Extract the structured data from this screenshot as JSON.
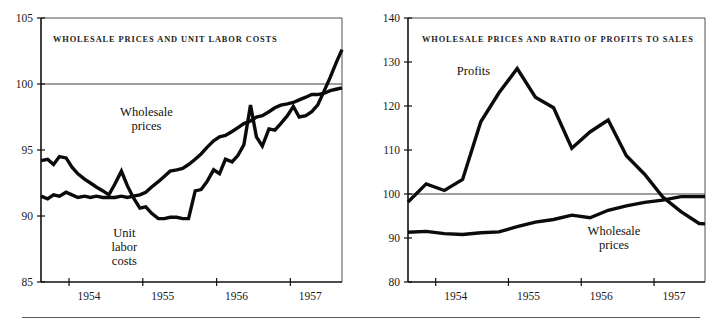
{
  "figure": {
    "background": "#ffffff",
    "line_color": "#0b0b0b",
    "axis_color": "#111111",
    "bottom_rule": true
  },
  "chart_data": [
    {
      "id": "left",
      "type": "line",
      "title": "WHOLESALE PRICES AND UNIT LABOR COSTS",
      "xlabel": "",
      "ylabel": "",
      "xlim": [
        1953.62,
        1957.7
      ],
      "ylim": [
        85,
        105
      ],
      "yticks": [
        85,
        90,
        95,
        100,
        105
      ],
      "ytick_labels": [
        "85",
        "90",
        "95",
        "100",
        "105"
      ],
      "xticks": [
        1954,
        1955,
        1956,
        1957
      ],
      "xtick_labels": [
        "1954",
        "1955",
        "1956",
        "1957"
      ],
      "grid": false,
      "reference_lines": [
        100
      ],
      "legend_position": "inline-annotations",
      "series": [
        {
          "name": "Wholesale prices",
          "label_x": 1955.05,
          "label_y": 97.6,
          "x": [
            1953.62,
            1953.71,
            1953.79,
            1953.87,
            1953.96,
            1954.04,
            1954.12,
            1954.21,
            1954.29,
            1954.37,
            1954.46,
            1954.54,
            1954.62,
            1954.71,
            1954.79,
            1954.87,
            1954.96,
            1955.04,
            1955.12,
            1955.21,
            1955.29,
            1955.37,
            1955.46,
            1955.54,
            1955.62,
            1955.71,
            1955.79,
            1955.87,
            1955.96,
            1956.04,
            1956.12,
            1956.21,
            1956.29,
            1956.37,
            1956.46,
            1956.54,
            1956.62,
            1956.71,
            1956.79,
            1956.87,
            1956.96,
            1957.04,
            1957.12,
            1957.21,
            1957.29,
            1957.37,
            1957.46,
            1957.54,
            1957.62,
            1957.7
          ],
          "y": [
            91.5,
            91.3,
            91.6,
            91.5,
            91.8,
            91.6,
            91.4,
            91.5,
            91.4,
            91.5,
            91.4,
            91.4,
            91.4,
            91.5,
            91.4,
            91.5,
            91.6,
            91.8,
            92.2,
            92.6,
            93.0,
            93.4,
            93.5,
            93.6,
            93.9,
            94.3,
            94.7,
            95.2,
            95.7,
            96.0,
            96.1,
            96.4,
            96.7,
            97.0,
            97.2,
            97.5,
            97.6,
            97.9,
            98.2,
            98.4,
            98.5,
            98.6,
            98.8,
            99.0,
            99.2,
            99.2,
            99.3,
            99.5,
            99.6,
            99.7
          ]
        },
        {
          "name": "Unit labor costs",
          "label_x": 1954.75,
          "label_y": 88.4,
          "x": [
            1953.62,
            1953.71,
            1953.79,
            1953.87,
            1953.96,
            1954.04,
            1954.12,
            1954.21,
            1954.29,
            1954.37,
            1954.46,
            1954.54,
            1954.62,
            1954.71,
            1954.79,
            1954.87,
            1954.96,
            1955.04,
            1955.12,
            1955.21,
            1955.29,
            1955.37,
            1955.46,
            1955.54,
            1955.62,
            1955.71,
            1955.79,
            1955.87,
            1955.96,
            1956.04,
            1956.12,
            1956.21,
            1956.29,
            1956.37,
            1956.46,
            1956.54,
            1956.62,
            1956.71,
            1956.79,
            1956.87,
            1956.96,
            1957.04,
            1957.12,
            1957.21,
            1957.29,
            1957.37,
            1957.46,
            1957.54,
            1957.62,
            1957.7
          ],
          "y": [
            94.2,
            94.3,
            93.9,
            94.5,
            94.4,
            93.7,
            93.2,
            92.8,
            92.5,
            92.2,
            91.9,
            91.6,
            92.4,
            93.4,
            92.3,
            91.4,
            90.6,
            90.7,
            90.2,
            89.8,
            89.8,
            89.9,
            89.9,
            89.8,
            89.8,
            91.9,
            92.0,
            92.6,
            93.5,
            93.2,
            94.3,
            94.1,
            94.6,
            95.4,
            98.4,
            96.0,
            95.3,
            96.6,
            96.5,
            97.0,
            97.6,
            98.3,
            97.5,
            97.6,
            97.9,
            98.4,
            99.5,
            100.5,
            101.6,
            102.6
          ]
        }
      ]
    },
    {
      "id": "right",
      "type": "line",
      "title": "WHOLESALE PRICES AND RATIO OF PROFITS TO SALES",
      "xlabel": "",
      "ylabel": "",
      "xlim": [
        1953.62,
        1957.7
      ],
      "ylim": [
        80,
        140
      ],
      "yticks": [
        80,
        90,
        100,
        110,
        120,
        130,
        140
      ],
      "ytick_labels": [
        "80",
        "90",
        "100",
        "110",
        "120",
        "130",
        "140"
      ],
      "xticks": [
        1954,
        1955,
        1956,
        1957
      ],
      "xtick_labels": [
        "1954",
        "1955",
        "1956",
        "1957"
      ],
      "grid": false,
      "reference_lines": [
        100
      ],
      "legend_position": "inline-annotations",
      "series": [
        {
          "name": "Profits",
          "label_x": 1954.52,
          "label_y": 127.0,
          "x": [
            1953.62,
            1953.87,
            1954.12,
            1954.37,
            1954.62,
            1954.87,
            1955.12,
            1955.37,
            1955.62,
            1955.87,
            1956.12,
            1956.37,
            1956.62,
            1956.87,
            1957.12,
            1957.37,
            1957.62,
            1957.7
          ],
          "y": [
            98.2,
            102.3,
            100.8,
            103.3,
            116.4,
            123.0,
            128.5,
            122.0,
            119.6,
            110.4,
            114.1,
            116.8,
            108.7,
            104.5,
            99.3,
            96.0,
            93.3,
            93.2
          ]
        },
        {
          "name": "Wholesale prices",
          "label_x": 1956.45,
          "label_y": 90.6,
          "x": [
            1953.62,
            1953.87,
            1954.12,
            1954.37,
            1954.62,
            1954.87,
            1955.12,
            1955.37,
            1955.62,
            1955.87,
            1956.12,
            1956.37,
            1956.62,
            1956.87,
            1957.12,
            1957.37,
            1957.62,
            1957.7
          ],
          "y": [
            91.3,
            91.5,
            91.0,
            90.8,
            91.2,
            91.4,
            92.6,
            93.6,
            94.2,
            95.2,
            94.6,
            96.3,
            97.3,
            98.1,
            98.6,
            99.4,
            99.4,
            99.4
          ]
        }
      ]
    }
  ]
}
